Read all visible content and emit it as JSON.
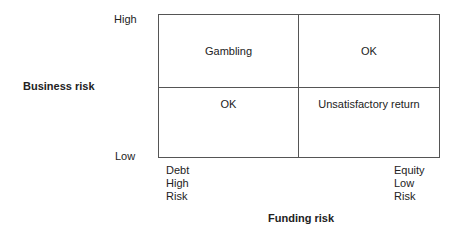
{
  "diagram": {
    "y_axis": {
      "title": "Business risk",
      "high_label": "High",
      "low_label": "Low"
    },
    "x_axis": {
      "title": "Funding risk",
      "left_label": [
        "Debt",
        "High",
        "Risk"
      ],
      "right_label": [
        "Equity",
        "Low",
        "Risk"
      ]
    },
    "quadrants": {
      "top_left": "Gambling",
      "top_right": "OK",
      "bottom_left": "OK",
      "bottom_right": "Unsatisfactory return"
    },
    "colors": {
      "line": "#555555",
      "text": "#222222",
      "background": "#ffffff"
    }
  }
}
